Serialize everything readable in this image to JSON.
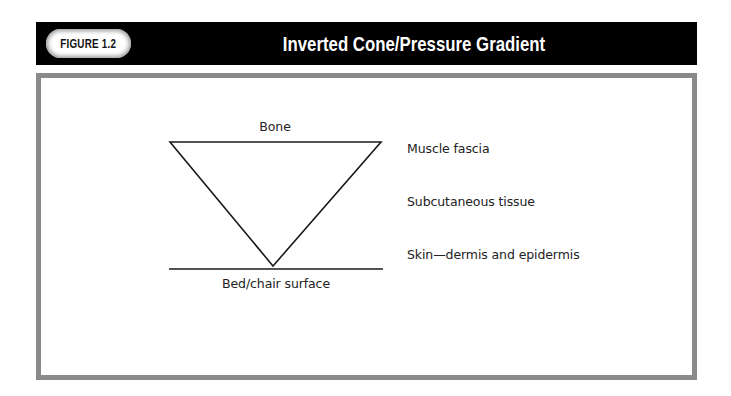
{
  "header": {
    "figure_label": "FIGURE 1.2",
    "title": "Inverted Cone/Pressure Gradient",
    "bar_color": "#000000",
    "badge_color": "#ffffff"
  },
  "panel": {
    "border_color": "#8a8a8a"
  },
  "diagram": {
    "top_label": "Bone",
    "bottom_label": "Bed/chair surface",
    "layers": [
      {
        "label": "Muscle fascia"
      },
      {
        "label": "Subcutaneous tissue"
      },
      {
        "label": "Skin—dermis and epidermis"
      }
    ],
    "shape": "inverted-triangle",
    "line_color": "#1a1a1a"
  }
}
